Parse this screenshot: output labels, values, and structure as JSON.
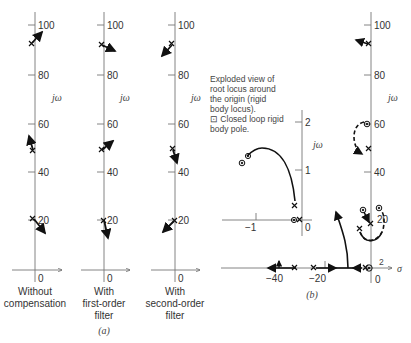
{
  "figure": {
    "part_a": {
      "caption": "(a)",
      "axis_label": "jω",
      "y_ticks": [
        "100",
        "80",
        "60",
        "40",
        "20"
      ],
      "origin_label": "0",
      "panels": [
        {
          "caption_lines": [
            "Without",
            "compensation"
          ]
        },
        {
          "caption_lines": [
            "With",
            "first-order",
            "filter"
          ]
        },
        {
          "caption_lines": [
            "With",
            "second-order",
            "filter"
          ]
        }
      ]
    },
    "part_b": {
      "caption": "(b)",
      "axis_label": "jω",
      "real_axis_label": "σ",
      "y_ticks": [
        "100",
        "80",
        "60",
        "40",
        "20"
      ],
      "x_ticks": [
        "−40",
        "−20"
      ],
      "origin_label": "0",
      "multiplicity_label": "2",
      "inset": {
        "note_lines": [
          "Exploded view of",
          "root locus around",
          "the origin (rigid",
          "body locus).",
          "⊡ Closed loop rigid",
          "body pole."
        ],
        "axis_label": "jω",
        "y_ticks": [
          "2",
          "1"
        ],
        "x_ticks": [
          "−1"
        ],
        "origin_label": "0"
      }
    }
  }
}
